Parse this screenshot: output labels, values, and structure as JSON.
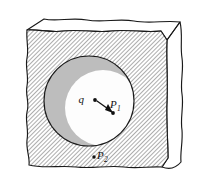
{
  "figure": {
    "colors": {
      "ink": "#1a1a1a",
      "hatch_line": "#6f6f6f",
      "hatch_background": "#ffffff",
      "right_face_gray": "#b9b9b9",
      "cavity_shadow_gray": "#bdbdbd",
      "cavity_lit_white": "#fdfdfd",
      "top_face_white": "#ffffff",
      "page_background": "#ffffff"
    },
    "labels": {
      "charge": {
        "name": "q",
        "text": "q",
        "subscript": "",
        "x": 86,
        "y": 99,
        "dot_x": 95,
        "dot_y": 100
      },
      "point_one": {
        "name": "P1",
        "text": "P",
        "subscript": "1",
        "x": 114,
        "y": 108,
        "dot_x": 113,
        "dot_y": 113
      },
      "point_two": {
        "name": "P2",
        "text": "P",
        "subscript": "2",
        "x": 100,
        "y": 158,
        "dot_x": 94,
        "dot_y": 157
      }
    },
    "vector": {
      "name": "q-to-P1-vector",
      "from_x": 97,
      "from_y": 101,
      "to_x": 112,
      "to_y": 112,
      "arrowhead": true
    },
    "cavity": {
      "center_x": 89,
      "center_y": 101,
      "radius": 45
    }
  }
}
